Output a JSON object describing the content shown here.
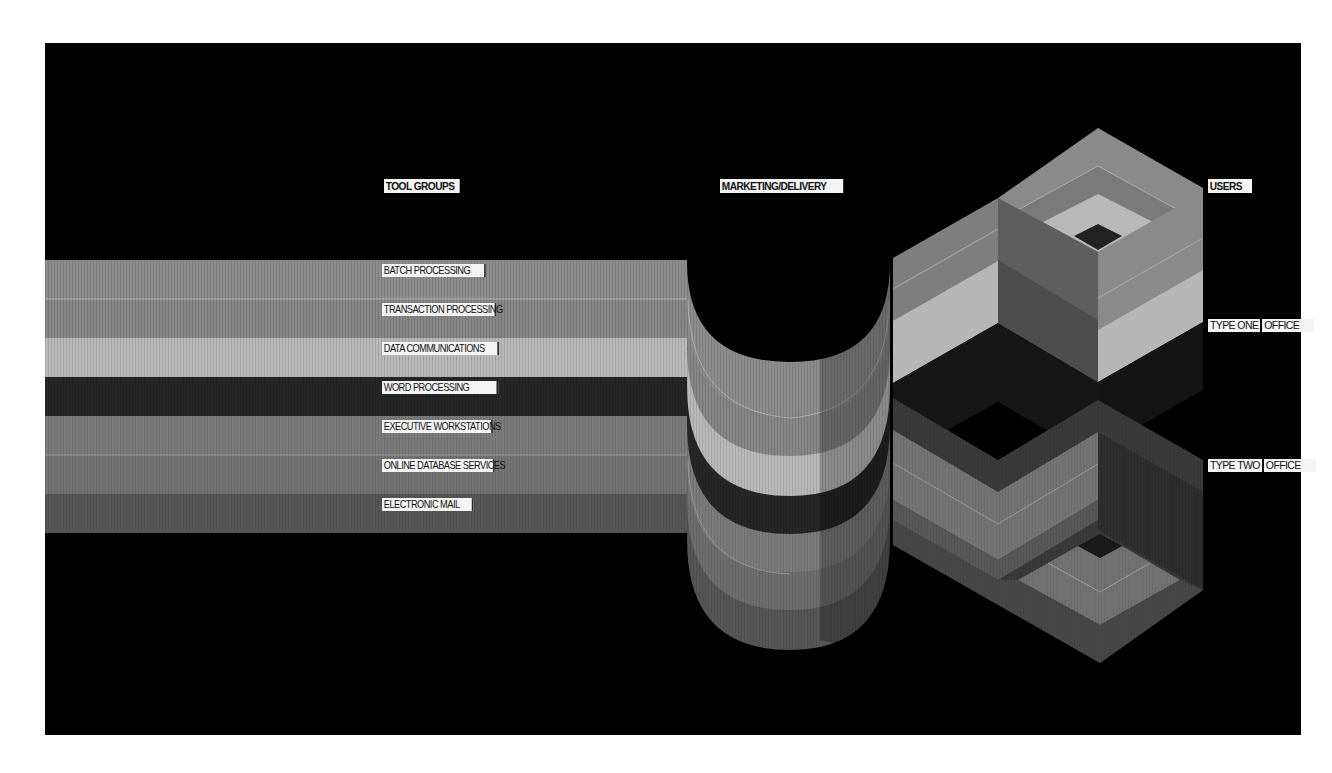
{
  "headings": {
    "tool_groups": "TOOL GROUPS",
    "marketing_delivery": "MARKETING/DELIVERY",
    "users": "USERS"
  },
  "tool_groups": [
    {
      "label": "BATCH PROCESSING",
      "color": "#8c8c8c"
    },
    {
      "label": "TRANSACTION PROCESSING",
      "color": "#868686"
    },
    {
      "label": "DATA COMMUNICATIONS",
      "color": "#b9b9b9"
    },
    {
      "label": "WORD PROCESSING",
      "color": "#262626"
    },
    {
      "label": "EXECUTIVE WORKSTATIONS",
      "color": "#7b7b7b"
    },
    {
      "label": "ONLINE DATABASE SERVICES",
      "color": "#747474"
    },
    {
      "label": "ELECTRONIC MAIL",
      "color": "#565656"
    }
  ],
  "users": [
    {
      "type": "TYPE ONE",
      "label": "OFFICE"
    },
    {
      "type": "TYPE TWO",
      "label": "OFFICE"
    }
  ],
  "colors": {
    "background": "#000000",
    "page": "#ffffff",
    "label_bg": "#f4f4f4"
  }
}
